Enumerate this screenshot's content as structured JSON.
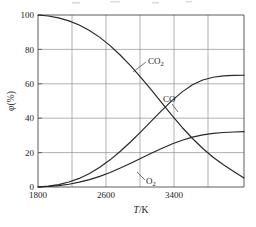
{
  "chart_data": {
    "type": "line",
    "title": "",
    "subtitle": "",
    "xlabel": "T/K",
    "ylabel": "φ(%)",
    "xlim": [
      1800,
      3800
    ],
    "ylim": [
      0,
      100
    ],
    "grid": true,
    "legend_position": "inline-annotations",
    "x_ticks": [
      {
        "value": 1800,
        "label": "1800"
      },
      {
        "value": 2600,
        "label": "2600"
      },
      {
        "value": 3400,
        "label": "3400"
      }
    ],
    "x_gridline_values": [
      1800,
      2200,
      2600,
      3000,
      3400,
      3800
    ],
    "y_ticks": [
      {
        "value": 0,
        "label": "0"
      },
      {
        "value": 20,
        "label": "20"
      },
      {
        "value": 40,
        "label": "40"
      },
      {
        "value": 60,
        "label": "60"
      },
      {
        "value": 80,
        "label": "80"
      },
      {
        "value": 100,
        "label": "100"
      }
    ],
    "x": [
      1800,
      1900,
      2000,
      2100,
      2200,
      2300,
      2400,
      2500,
      2600,
      2700,
      2800,
      2900,
      3000,
      3100,
      3200,
      3300,
      3400,
      3500,
      3600,
      3700,
      3800
    ],
    "series": [
      {
        "name": "CO2",
        "label": "CO₂",
        "values": [
          100,
          99.4,
          98.3,
          96.6,
          94.2,
          91.0,
          87.0,
          82.2,
          76.6,
          70.4,
          63.6,
          56.4,
          49.0,
          41.6,
          34.6,
          28.2,
          22.4,
          17.3,
          12.9,
          9.0,
          5.2
        ]
      },
      {
        "name": "CO",
        "label": "CO",
        "values": [
          0,
          0.5,
          1.4,
          2.9,
          5.0,
          7.9,
          11.5,
          15.8,
          20.8,
          26.3,
          32.2,
          38.3,
          44.4,
          50.2,
          55.3,
          59.4,
          62.2,
          63.8,
          64.6,
          64.9,
          65.0
        ]
      },
      {
        "name": "O2",
        "label": "O₂",
        "values": [
          0,
          0.3,
          0.8,
          1.6,
          2.8,
          4.3,
          6.2,
          8.4,
          11.0,
          13.8,
          16.7,
          19.6,
          22.4,
          25.0,
          27.2,
          29.0,
          30.3,
          31.2,
          31.7,
          32.0,
          32.2
        ]
      }
    ],
    "annotations": [
      {
        "text": "CO₂",
        "series": "CO2",
        "x_px": 150,
        "y_px": 62
      },
      {
        "text": "CO",
        "series": "CO",
        "x_px": 170,
        "y_px": 101
      },
      {
        "text": "O₂",
        "series": "O2",
        "x_px": 148,
        "y_px": 181
      }
    ],
    "colors": {
      "curve": "#262626",
      "grid": "#7d7d7d",
      "frame": "#4a4a4a",
      "background": "#ffffff"
    }
  }
}
